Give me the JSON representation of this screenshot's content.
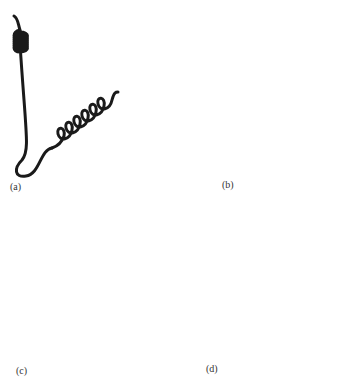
{
  "figure": {
    "panels": [
      {
        "id": "a",
        "label": "(a)",
        "description": "helix-loop-helix"
      },
      {
        "id": "b",
        "label": "(b)",
        "description": "beta-alpha-beta"
      },
      {
        "id": "c",
        "label": "(c)",
        "description": "beta hairpin"
      },
      {
        "id": "d",
        "label": "(d)",
        "description": "greek key"
      }
    ],
    "colors": {
      "line": "#1a1a1a",
      "strand_fill_light": "#e6e6e6",
      "strand_fill_dark": "#a8a8a8",
      "background": "#ffffff"
    }
  }
}
